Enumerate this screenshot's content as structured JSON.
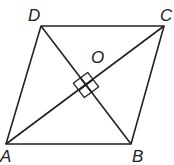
{
  "figure": {
    "type": "rhombus with diagonals",
    "stroke_color": "#222222",
    "vertices": {
      "A": {
        "label": "A",
        "x": 6,
        "y": 144
      },
      "B": {
        "label": "B",
        "x": 131,
        "y": 144
      },
      "C": {
        "label": "C",
        "x": 164,
        "y": 26
      },
      "D": {
        "label": "D",
        "x": 41,
        "y": 26
      }
    },
    "center": {
      "label": "O",
      "x": 86,
      "y": 85
    },
    "right_angle_marks": 4
  }
}
